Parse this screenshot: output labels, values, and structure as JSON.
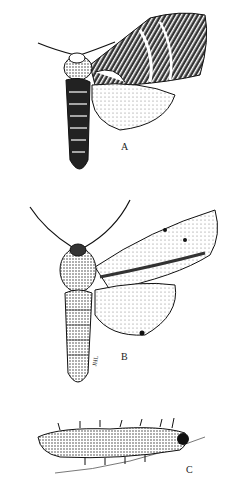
{
  "plate": {
    "description": "Scientific illustration plate of moths and larva",
    "figures": [
      {
        "id": "A",
        "label": "A",
        "subject": "moth, dorsal view, wings spread on one side, banded forewing"
      },
      {
        "id": "B",
        "label": "B",
        "subject": "moth, dorsal view, speckled forewing, pale hindwing",
        "signature": "JHL"
      },
      {
        "id": "C",
        "label": "C",
        "subject": "spiny caterpillar on a twig"
      }
    ]
  },
  "colors": {
    "ink": "#111111",
    "paper": "#ffffff",
    "shade": "#555555",
    "light": "#bbbbbb"
  }
}
